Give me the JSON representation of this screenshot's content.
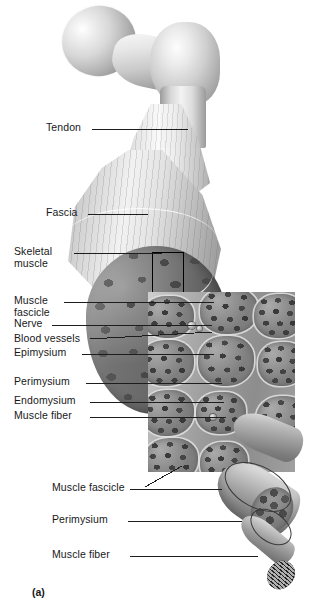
{
  "figure": {
    "caption": "(a)",
    "background_color": "#ffffff",
    "line_color": "#1d1d1f",
    "text_color": "#18181a"
  },
  "labels": [
    {
      "id": "tendon",
      "text": "Tendon",
      "lines": [
        "Tendon"
      ]
    },
    {
      "id": "fascia",
      "text": "Fascia",
      "lines": [
        "Fascia"
      ]
    },
    {
      "id": "skeletal-muscle",
      "text": "Skeletal muscle",
      "lines": [
        "Skeletal",
        "muscle"
      ]
    },
    {
      "id": "muscle-fascicle-upper",
      "text": "Muscle fascicle",
      "lines": [
        "Muscle",
        "fascicle"
      ]
    },
    {
      "id": "nerve",
      "text": "Nerve",
      "lines": [
        "Nerve"
      ]
    },
    {
      "id": "blood-vessels",
      "text": "Blood vessels",
      "lines": [
        "Blood vessels"
      ]
    },
    {
      "id": "epimysium",
      "text": "Epimysium",
      "lines": [
        "Epimysium"
      ]
    },
    {
      "id": "perimysium-upper",
      "text": "Perimysium",
      "lines": [
        "Perimysium"
      ]
    },
    {
      "id": "endomysium",
      "text": "Endomysium",
      "lines": [
        "Endomysium"
      ]
    },
    {
      "id": "muscle-fiber-upper",
      "text": "Muscle fiber",
      "lines": [
        "Muscle fiber"
      ]
    },
    {
      "id": "muscle-fascicle-lower",
      "text": "Muscle fascicle",
      "lines": [
        "Muscle fascicle"
      ]
    },
    {
      "id": "perimysium-lower",
      "text": "Perimysium",
      "lines": [
        "Perimysium"
      ]
    },
    {
      "id": "muscle-fiber-lower",
      "text": "Muscle fiber",
      "lines": [
        "Muscle fiber"
      ]
    }
  ],
  "label_text": {
    "tendon": "Tendon",
    "fascia": "Fascia",
    "skeletal_muscle_l1": "Skeletal",
    "skeletal_muscle_l2": "muscle",
    "muscle_fascicle_u_l1": "Muscle",
    "muscle_fascicle_u_l2": "fascicle",
    "nerve": "Nerve",
    "blood_vessels": "Blood vessels",
    "epimysium": "Epimysium",
    "perimysium_upper": "Perimysium",
    "endomysium": "Endomysium",
    "muscle_fiber_upper": "Muscle fiber",
    "muscle_fascicle_lower": "Muscle fascicle",
    "perimysium_lower": "Perimysium",
    "muscle_fiber_lower": "Muscle fiber",
    "caption": "(a)"
  },
  "artwork": {
    "bone": "proximal-femur-head-neck-greater-trochanter",
    "tendon": "tendon-fan-attaching-to-bone",
    "fascia": "fascia-sheet-over-muscle-belly",
    "muscle_belly": "cut-muscle-belly-showing-fascicle-mosaic",
    "zoom_marker": "black-rectangle-marking-magnified-region",
    "inset_panel": "magnified-cross-section-of-fascicles",
    "bottom_cylinder": "isolated-fascicle-with-muscle-fibers",
    "bottom_fiber": "single-muscle-fiber-with-myofibrils"
  }
}
